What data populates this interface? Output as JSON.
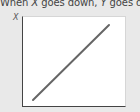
{
  "caption": {
    "prefix": "When ",
    "var_x": "X",
    "middle": " goes down, ",
    "var_y": "Y",
    "suffix": " goes down."
  },
  "chart_data": {
    "type": "line",
    "title": "When X goes down, Y goes down.",
    "xlabel": "",
    "ylabel": "X",
    "grid": false,
    "series": [
      {
        "name": "relationship",
        "x": [
          0,
          1
        ],
        "y": [
          0,
          1
        ]
      }
    ],
    "line_color": "#666666",
    "annotations": []
  }
}
